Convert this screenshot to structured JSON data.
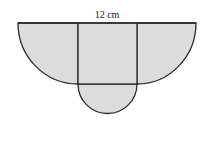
{
  "diagram": {
    "type": "composite-shape",
    "top_label": "12 cm",
    "colors": {
      "fill": "#dcdcdc",
      "stroke": "#2a2a2a",
      "background": "#ffffff"
    },
    "parts": [
      {
        "name": "left-quarter-ellipse"
      },
      {
        "name": "center-square"
      },
      {
        "name": "right-quarter-ellipse"
      },
      {
        "name": "bottom-semicircle"
      }
    ]
  }
}
